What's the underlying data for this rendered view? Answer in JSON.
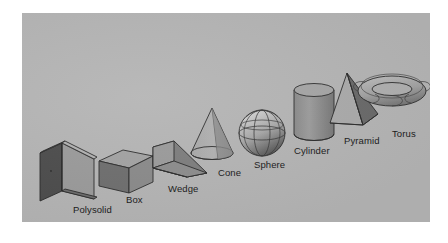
{
  "figure": {
    "kind": "3d-solid-primitives-illustration",
    "background_color": "#ffffff",
    "panel_color": "#b5b5b5",
    "label_color": "#1a1a1a",
    "outline_color": "#2b2b2b"
  },
  "shapes": [
    {
      "name": "polysolid",
      "label": "Polysolid",
      "label_x": 51,
      "label_y": 192,
      "fill_light": "#9a9a9a",
      "fill_mid": "#7d7d7d",
      "fill_dark": "#4f4f4f"
    },
    {
      "name": "box",
      "label": "Box",
      "label_x": 104,
      "label_y": 182,
      "fill_light": "#9c9c9c",
      "fill_mid": "#828282",
      "fill_dark": "#5e5e5e"
    },
    {
      "name": "wedge",
      "label": "Wedge",
      "label_x": 146,
      "label_y": 171,
      "fill_light": "#a0a0a0",
      "fill_mid": "#7f7f7f",
      "fill_dark": "#555555"
    },
    {
      "name": "cone",
      "label": "Cone",
      "label_x": 196,
      "label_y": 155,
      "fill_light": "#adadad",
      "fill_mid": "#8d8d8d",
      "fill_dark": "#6e6e6e"
    },
    {
      "name": "sphere",
      "label": "Sphere",
      "label_x": 232,
      "label_y": 147,
      "fill_light": "#c4c4c4",
      "fill_mid": "#9a9a9a",
      "fill_dark": "#5a5a5a"
    },
    {
      "name": "cylinder",
      "label": "Cylinder",
      "label_x": 272,
      "label_y": 133,
      "fill_light": "#ababab",
      "fill_mid": "#8f8f8f",
      "fill_dark": "#767676"
    },
    {
      "name": "pyramid",
      "label": "Pyramid",
      "label_x": 322,
      "label_y": 123,
      "fill_light": "#b0b0b0",
      "fill_mid": "#8e8e8e",
      "fill_dark": "#5f5f5f"
    },
    {
      "name": "torus",
      "label": "Torus",
      "label_x": 370,
      "label_y": 116,
      "fill_light": "#bdbdbd",
      "fill_mid": "#9d9d9d",
      "fill_dark": "#6b6b6b"
    }
  ]
}
